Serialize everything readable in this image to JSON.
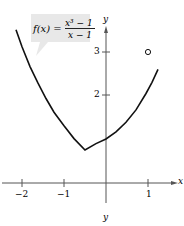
{
  "figure": {
    "function_label": {
      "lhs": "f(x) =",
      "numerator": "x³ − 1",
      "denominator": "x − 1"
    },
    "axes": {
      "x_label": "x",
      "y_label": "y",
      "x_ticks": [
        "−2",
        "−1",
        "1"
      ],
      "y_ticks": [
        "2",
        "3"
      ],
      "bottom_caption": "y"
    },
    "hole_point": {
      "x": 1,
      "y": 3
    },
    "colors": {
      "curve": "#111111",
      "axis": "#555555",
      "callout_bg": "#e6e6e6"
    }
  }
}
